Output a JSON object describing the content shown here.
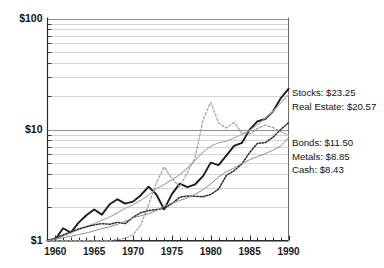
{
  "chart_data": {
    "type": "line",
    "title": "",
    "subtitle": "",
    "xlabel": "",
    "ylabel": "",
    "scale": "log",
    "grid": true,
    "legend_position": "right",
    "xlim": [
      1959,
      1990
    ],
    "ylim": [
      1,
      100
    ],
    "x_major_ticks": [
      1960,
      1965,
      1970,
      1975,
      1980,
      1985,
      1990
    ],
    "x_tick_labels": [
      "1960",
      "1965",
      "1970",
      "1975",
      "1980",
      "1985",
      "1990"
    ],
    "x_minor_tick_step": 1,
    "y_major_ticks": [
      1,
      10,
      100
    ],
    "y_tick_labels": [
      "$1",
      "$10",
      "$100"
    ],
    "y_minor_ticks": [
      2,
      3,
      4,
      5,
      6,
      7,
      8,
      9,
      20,
      30,
      40,
      50,
      60,
      70,
      80,
      90
    ],
    "x": [
      1959,
      1960,
      1961,
      1962,
      1963,
      1964,
      1965,
      1966,
      1967,
      1968,
      1969,
      1970,
      1971,
      1972,
      1973,
      1974,
      1975,
      1976,
      1977,
      1978,
      1979,
      1980,
      1981,
      1982,
      1983,
      1984,
      1985,
      1986,
      1987,
      1988,
      1989,
      1990
    ],
    "series": [
      {
        "name": "Stocks",
        "end_value": 23.25,
        "end_label": "Stocks: $23.25",
        "color": "#1c1c1c",
        "style": "solid",
        "width": 1.9,
        "values": [
          1.0,
          1.02,
          1.29,
          1.18,
          1.45,
          1.69,
          1.9,
          1.71,
          2.12,
          2.35,
          2.15,
          2.24,
          2.56,
          3.05,
          2.6,
          1.91,
          2.62,
          3.25,
          3.02,
          3.21,
          3.8,
          5.03,
          4.78,
          5.81,
          7.12,
          7.57,
          9.97,
          11.82,
          12.44,
          14.5,
          19.1,
          23.25
        ]
      },
      {
        "name": "Real Estate",
        "end_value": 20.57,
        "end_label": "Real Estate: $20.57",
        "color": "#a8a8a8",
        "style": "solid",
        "width": 1.1,
        "values": [
          1.0,
          1.04,
          1.1,
          1.17,
          1.25,
          1.33,
          1.42,
          1.52,
          1.63,
          1.78,
          1.95,
          2.1,
          2.3,
          2.56,
          2.92,
          3.2,
          3.52,
          3.9,
          4.5,
          5.3,
          6.25,
          7.05,
          7.6,
          7.85,
          8.4,
          9.0,
          9.8,
          11.0,
          12.6,
          14.6,
          17.4,
          20.57
        ]
      },
      {
        "name": "Bonds",
        "end_value": 11.5,
        "end_label": "Bonds: $11.50",
        "color": "#2e2e2e",
        "style": "dotted",
        "width": 1.5,
        "values": [
          1.0,
          1.05,
          1.12,
          1.2,
          1.27,
          1.33,
          1.38,
          1.42,
          1.4,
          1.46,
          1.42,
          1.62,
          1.78,
          1.86,
          1.9,
          1.94,
          2.15,
          2.45,
          2.52,
          2.5,
          2.48,
          2.6,
          2.9,
          3.85,
          4.25,
          4.9,
          6.2,
          7.5,
          7.6,
          8.5,
          10.0,
          11.5
        ]
      },
      {
        "name": "Metals",
        "end_value": 8.85,
        "end_label": "Metals: $8.85",
        "color": "#9a9a9a",
        "style": "dashed",
        "width": 1.1,
        "values": [
          1.0,
          1.0,
          1.0,
          1.0,
          1.0,
          1.0,
          1.0,
          1.0,
          1.0,
          1.02,
          1.05,
          1.12,
          1.38,
          2.1,
          3.3,
          4.6,
          3.6,
          3.05,
          4.1,
          5.6,
          12.2,
          17.6,
          11.5,
          10.3,
          11.6,
          9.3,
          9.1,
          10.2,
          11.0,
          10.4,
          9.6,
          8.85
        ]
      },
      {
        "name": "Cash",
        "end_value": 8.43,
        "end_label": "Cash: $8.43",
        "color": "#8c8c8c",
        "style": "solid",
        "width": 1.0,
        "values": [
          1.0,
          1.03,
          1.06,
          1.09,
          1.13,
          1.17,
          1.22,
          1.28,
          1.33,
          1.4,
          1.49,
          1.6,
          1.67,
          1.74,
          1.86,
          2.04,
          2.17,
          2.29,
          2.42,
          2.6,
          2.88,
          3.23,
          3.73,
          4.16,
          4.5,
          4.93,
          5.34,
          5.7,
          6.05,
          6.5,
          7.11,
          8.43
        ]
      }
    ],
    "legend_groups": [
      [
        "Stocks: $23.25",
        "Real Estate: $20.57"
      ],
      [
        "Bonds: $11.50",
        "Metals: $8.85",
        "Cash: $8.43"
      ]
    ]
  }
}
